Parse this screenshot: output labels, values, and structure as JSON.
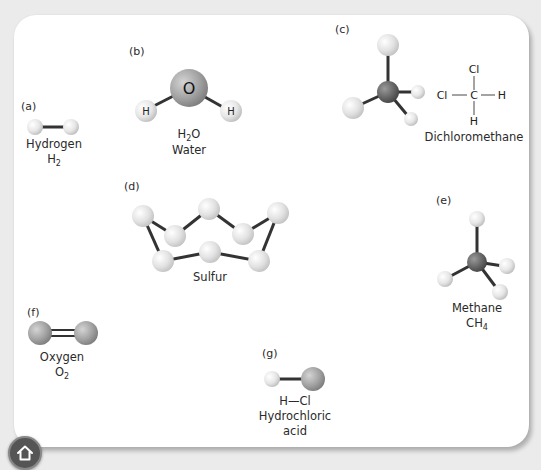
{
  "molecules": {
    "a": {
      "tag": "(a)",
      "name": "Hydrogen",
      "formula_main": "H",
      "formula_sub": "2"
    },
    "b": {
      "tag": "(b)",
      "formula_pre": "H",
      "formula_sub": "2",
      "formula_post": "O",
      "name": "Water",
      "atom_center": "O",
      "atom_left": "H",
      "atom_right": "H"
    },
    "c": {
      "tag": "(c)",
      "name": "Dichloromethane",
      "structural": {
        "top": "Cl",
        "left": "Cl",
        "center": "C",
        "right": "H",
        "bottom": "H"
      }
    },
    "d": {
      "tag": "(d)",
      "name": "Sulfur"
    },
    "e": {
      "tag": "(e)",
      "name": "Methane",
      "formula_main": "CH",
      "formula_sub": "4"
    },
    "f": {
      "tag": "(f)",
      "name": "Oxygen",
      "formula_main": "O",
      "formula_sub": "2"
    },
    "g": {
      "tag": "(g)",
      "formula": "H—Cl",
      "name_line1": "Hydrochloric",
      "name_line2": "acid"
    }
  },
  "nav": {
    "home_icon": "home-icon"
  },
  "colors": {
    "hydrogen": "#e8e8e8",
    "oxygen": "#a6a6a6",
    "carbon": "#666666",
    "chlorine": "#d8d8d8",
    "sulfur": "#e4e4e4",
    "bond": "#333333",
    "background": "#ebebeb",
    "card": "#ffffff"
  }
}
